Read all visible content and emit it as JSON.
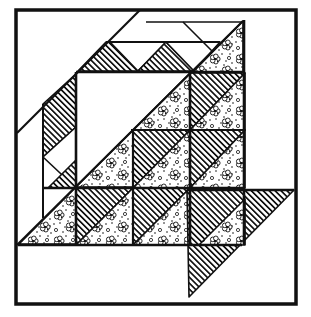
{
  "figure": {
    "background_color": "#ffffff",
    "ink_color": "#111111",
    "canvas": {
      "width": 311,
      "height": 317
    },
    "border": {
      "x": 16,
      "y": 10,
      "w": 280,
      "h": 294,
      "stroke_width": 3.5
    }
  },
  "patterns": {
    "hatch": {
      "spacing": 4.2,
      "line_width": 1.7,
      "angle": -45
    },
    "floral": {
      "tile": 26,
      "flowers": [
        [
          7,
          7
        ],
        [
          19,
          19
        ]
      ],
      "rings": [
        [
          21,
          6
        ],
        [
          4,
          22
        ]
      ],
      "dots": [
        [
          14,
          2
        ],
        [
          2,
          16
        ],
        [
          24,
          11
        ],
        [
          11,
          24
        ],
        [
          22,
          2
        ],
        [
          4,
          4
        ],
        [
          16,
          13
        ],
        [
          25,
          25
        ],
        [
          8,
          15
        ],
        [
          18,
          9
        ],
        [
          13,
          19
        ],
        [
          24,
          18
        ]
      ]
    }
  },
  "shapes": [
    {
      "name": "band-hatch-top-left-arm",
      "fill": "hatch",
      "pts": [
        [
          78,
          71
        ],
        [
          106,
          42
        ],
        [
          110,
          42
        ],
        [
          138,
          71
        ]
      ]
    },
    {
      "name": "sawtooth-white-notch-1",
      "fill": "white",
      "pts": [
        [
          110,
          42
        ],
        [
          166,
          42
        ],
        [
          138,
          71
        ]
      ]
    },
    {
      "name": "sawtooth-hatch-tooth-top",
      "fill": "hatch",
      "pts": [
        [
          166,
          42
        ],
        [
          194,
          71
        ],
        [
          138,
          71
        ]
      ]
    },
    {
      "name": "sawtooth-white-notch-2",
      "fill": "white",
      "pts": [
        [
          166,
          42
        ],
        [
          220,
          42
        ],
        [
          194,
          71
        ]
      ]
    },
    {
      "name": "floral-corner-top-right",
      "fill": "floral",
      "pts": [
        [
          193,
          72
        ],
        [
          243,
          21
        ],
        [
          243,
          72
        ]
      ]
    },
    {
      "name": "band-hatch-left-arm",
      "fill": "hatch",
      "pts": [
        [
          76,
          74
        ],
        [
          43,
          104
        ],
        [
          43,
          157
        ],
        [
          76,
          127
        ]
      ]
    },
    {
      "name": "sawtooth-white-notch-3",
      "fill": "white",
      "pts": [
        [
          43,
          157
        ],
        [
          76,
          127
        ],
        [
          76,
          188
        ]
      ]
    },
    {
      "name": "sawtooth-hatch-tooth-left",
      "fill": "hatch",
      "pts": [
        [
          76,
          160
        ],
        [
          76,
          188
        ],
        [
          48,
          188
        ]
      ]
    },
    {
      "name": "floral-triangle-lower-left",
      "fill": "floral",
      "pts": [
        [
          19,
          244
        ],
        [
          76,
          187
        ],
        [
          76,
          244
        ]
      ]
    },
    {
      "name": "floral-center-left",
      "fill": "floral",
      "pts": [
        [
          76,
          187
        ],
        [
          133,
          130
        ],
        [
          133,
          187
        ]
      ]
    },
    {
      "name": "floral-center-top",
      "fill": "floral",
      "pts": [
        [
          133,
          130
        ],
        [
          190,
          73
        ],
        [
          190,
          130
        ]
      ]
    },
    {
      "name": "hatch-unit-mid-center",
      "fill": "hatch",
      "pts": [
        [
          133,
          130
        ],
        [
          190,
          130
        ],
        [
          133,
          188
        ]
      ]
    },
    {
      "name": "floral-unit-mid-center",
      "fill": "floral",
      "pts": [
        [
          190,
          130
        ],
        [
          190,
          188
        ],
        [
          133,
          188
        ]
      ]
    },
    {
      "name": "hatch-unit-right-top",
      "fill": "hatch",
      "pts": [
        [
          190,
          73
        ],
        [
          245,
          73
        ],
        [
          190,
          130
        ]
      ]
    },
    {
      "name": "floral-unit-right-top",
      "fill": "floral",
      "pts": [
        [
          245,
          73
        ],
        [
          245,
          130
        ],
        [
          190,
          130
        ]
      ]
    },
    {
      "name": "hatch-unit-right-mid",
      "fill": "hatch",
      "pts": [
        [
          190,
          130
        ],
        [
          245,
          130
        ],
        [
          190,
          188
        ]
      ]
    },
    {
      "name": "floral-unit-right-mid",
      "fill": "floral",
      "pts": [
        [
          245,
          130
        ],
        [
          245,
          188
        ],
        [
          190,
          188
        ]
      ]
    },
    {
      "name": "hatch-unit-left-bottom",
      "fill": "hatch",
      "pts": [
        [
          76,
          188
        ],
        [
          133,
          188
        ],
        [
          76,
          245
        ]
      ]
    },
    {
      "name": "floral-unit-left-bottom",
      "fill": "floral",
      "pts": [
        [
          133,
          188
        ],
        [
          133,
          245
        ],
        [
          76,
          245
        ]
      ]
    },
    {
      "name": "hatch-unit-mid-bottom",
      "fill": "hatch",
      "pts": [
        [
          133,
          188
        ],
        [
          190,
          188
        ],
        [
          133,
          245
        ]
      ]
    },
    {
      "name": "floral-unit-mid-bottom",
      "fill": "floral",
      "pts": [
        [
          190,
          188
        ],
        [
          190,
          245
        ],
        [
          133,
          245
        ]
      ]
    },
    {
      "name": "hatch-big-triangle-bottom-right",
      "fill": "hatch",
      "pts": [
        [
          187,
          190
        ],
        [
          294,
          190
        ],
        [
          189,
          297
        ]
      ]
    },
    {
      "name": "floral-unit-right-bottom",
      "fill": "floral",
      "pts": [
        [
          199,
          245
        ],
        [
          245,
          199
        ],
        [
          245,
          245
        ]
      ]
    }
  ],
  "lines": [
    {
      "name": "diagonal-outer",
      "x1": 17,
      "y1": 133,
      "x2": 140,
      "y2": 10,
      "w": 2.2
    },
    {
      "name": "diagonal-main",
      "x1": 17,
      "y1": 245,
      "x2": 243,
      "y2": 21,
      "w": 2.2
    },
    {
      "name": "seam-vertical-43",
      "x1": 43,
      "y1": 104,
      "x2": 43,
      "y2": 218,
      "w": 2
    },
    {
      "name": "seam-top-strip",
      "x1": 146,
      "y1": 22,
      "x2": 243,
      "y2": 22,
      "w": 1.6
    },
    {
      "name": "seam-top-notch",
      "x1": 183,
      "y1": 22,
      "x2": 212,
      "y2": 51,
      "w": 1.6
    },
    {
      "name": "seam-horizontal-42",
      "x1": 106,
      "y1": 42,
      "x2": 220,
      "y2": 42,
      "w": 2
    },
    {
      "name": "grid-vertical-right",
      "x1": 244,
      "y1": 20,
      "x2": 244,
      "y2": 245,
      "w": 2.6
    },
    {
      "name": "grid-horizontal-top",
      "x1": 76,
      "y1": 72,
      "x2": 244,
      "y2": 72,
      "w": 2.6
    },
    {
      "name": "grid-vertical-left",
      "x1": 76,
      "y1": 72,
      "x2": 76,
      "y2": 245,
      "w": 2.6
    },
    {
      "name": "grid-horizontal-mid",
      "x1": 44,
      "y1": 188,
      "x2": 245,
      "y2": 188,
      "w": 2.6
    },
    {
      "name": "big-triangle-top-edge",
      "x1": 187,
      "y1": 190,
      "x2": 294,
      "y2": 190,
      "w": 2.6
    },
    {
      "name": "grid-vertical-133",
      "x1": 133,
      "y1": 129,
      "x2": 133,
      "y2": 245,
      "w": 2.2
    },
    {
      "name": "grid-horizontal-130",
      "x1": 131,
      "y1": 130,
      "x2": 245,
      "y2": 130,
      "w": 2.2
    },
    {
      "name": "grid-vertical-190",
      "x1": 190,
      "y1": 72,
      "x2": 190,
      "y2": 245,
      "w": 2.6
    },
    {
      "name": "grid-horizontal-245",
      "x1": 18,
      "y1": 245,
      "x2": 242,
      "y2": 245,
      "w": 2.6
    }
  ]
}
